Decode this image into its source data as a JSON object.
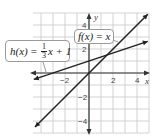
{
  "graph": {
    "x_axis_label": "x",
    "y_axis_label": "y",
    "x_ticks": [
      {
        "value": -2,
        "label": "−2"
      },
      {
        "value": 2,
        "label": "2"
      },
      {
        "value": 4,
        "label": "4"
      }
    ],
    "y_ticks": [
      {
        "value": 4,
        "label": "4"
      },
      {
        "value": 2,
        "label": "2"
      },
      {
        "value": -2,
        "label": "−2"
      },
      {
        "value": -4,
        "label": "−4"
      }
    ],
    "xlim": [
      -4.6,
      5
    ],
    "ylim": [
      -5,
      5
    ],
    "grid": true,
    "colors": {
      "grid": "#c8c8c8",
      "axis": "#333333",
      "line": "#222222",
      "text": "#444444"
    }
  },
  "functions": [
    {
      "id": "f",
      "name": "f(x)",
      "equals": "=",
      "expression": "x",
      "slope": 1,
      "intercept": 0
    },
    {
      "id": "h",
      "name": "h(x)",
      "equals": "=",
      "frac_num": "1",
      "frac_den": "3",
      "expression_rest": "x + 1",
      "slope": 0.3333,
      "intercept": 1
    }
  ]
}
